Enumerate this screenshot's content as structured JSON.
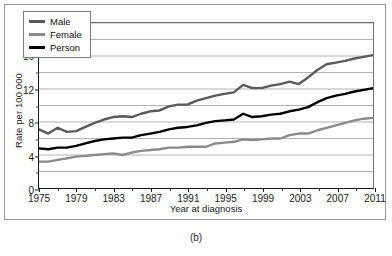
{
  "figure": {
    "caption": "(b)"
  },
  "chart_data": {
    "type": "line",
    "title": "",
    "xlabel": "Year at diagnosis",
    "ylabel": "Rate per 100 000",
    "xlim": [
      1975,
      2011
    ],
    "ylim": [
      0,
      20
    ],
    "grid": true,
    "grid_axis": "y",
    "legend_position": "top-left",
    "y_ticks_major": [
      0,
      4,
      8,
      12,
      16,
      20
    ],
    "y_ticks_minor": [
      2,
      6,
      10,
      14,
      18
    ],
    "y_tick_labels": [
      "0",
      "4",
      "8",
      "12",
      "16",
      "20"
    ],
    "x_ticks_major": [
      1975,
      1979,
      1983,
      1987,
      1991,
      1995,
      1999,
      2003,
      2007,
      2011
    ],
    "x_tick_labels": [
      "1975",
      "1979",
      "1983",
      "1987",
      "1991",
      "1995",
      "1999",
      "2003",
      "2007",
      "2011"
    ],
    "x_ticks_minor": [
      1977,
      1981,
      1985,
      1989,
      1993,
      1997,
      2001,
      2005,
      2009
    ],
    "x": [
      1975,
      1976,
      1977,
      1978,
      1979,
      1980,
      1981,
      1982,
      1983,
      1984,
      1985,
      1986,
      1987,
      1988,
      1989,
      1990,
      1991,
      1992,
      1993,
      1994,
      1995,
      1996,
      1997,
      1998,
      1999,
      2000,
      2001,
      2002,
      2003,
      2004,
      2005,
      2006,
      2007,
      2008,
      2009,
      2010,
      2011
    ],
    "series": [
      {
        "name": "Male",
        "color": "#5a5a5a",
        "values": [
          7.1,
          6.6,
          7.3,
          6.8,
          6.9,
          7.4,
          7.9,
          8.3,
          8.6,
          8.7,
          8.6,
          9.0,
          9.3,
          9.4,
          9.9,
          10.1,
          10.1,
          10.6,
          10.9,
          11.2,
          11.4,
          11.6,
          12.5,
          12.1,
          12.1,
          12.4,
          12.6,
          12.9,
          12.6,
          13.4,
          14.3,
          15.0,
          15.2,
          15.4,
          15.7,
          15.9,
          16.1
        ]
      },
      {
        "name": "Female",
        "color": "#8a8a8a",
        "values": [
          3.2,
          3.2,
          3.4,
          3.6,
          3.8,
          3.9,
          4.0,
          4.1,
          4.2,
          4.0,
          4.3,
          4.5,
          4.6,
          4.7,
          4.9,
          4.9,
          5.0,
          5.0,
          5.0,
          5.4,
          5.5,
          5.6,
          5.9,
          5.8,
          5.9,
          6.0,
          6.0,
          6.4,
          6.6,
          6.6,
          7.0,
          7.3,
          7.6,
          7.9,
          8.2,
          8.4,
          8.5
        ]
      },
      {
        "name": "Person",
        "color": "#000000",
        "values": [
          4.8,
          4.7,
          4.9,
          4.9,
          5.1,
          5.4,
          5.7,
          5.9,
          6.0,
          6.1,
          6.1,
          6.4,
          6.6,
          6.8,
          7.1,
          7.3,
          7.4,
          7.6,
          7.9,
          8.1,
          8.2,
          8.3,
          9.0,
          8.6,
          8.7,
          8.9,
          9.0,
          9.3,
          9.5,
          9.8,
          10.4,
          10.9,
          11.2,
          11.4,
          11.7,
          11.9,
          12.1
        ]
      }
    ]
  }
}
